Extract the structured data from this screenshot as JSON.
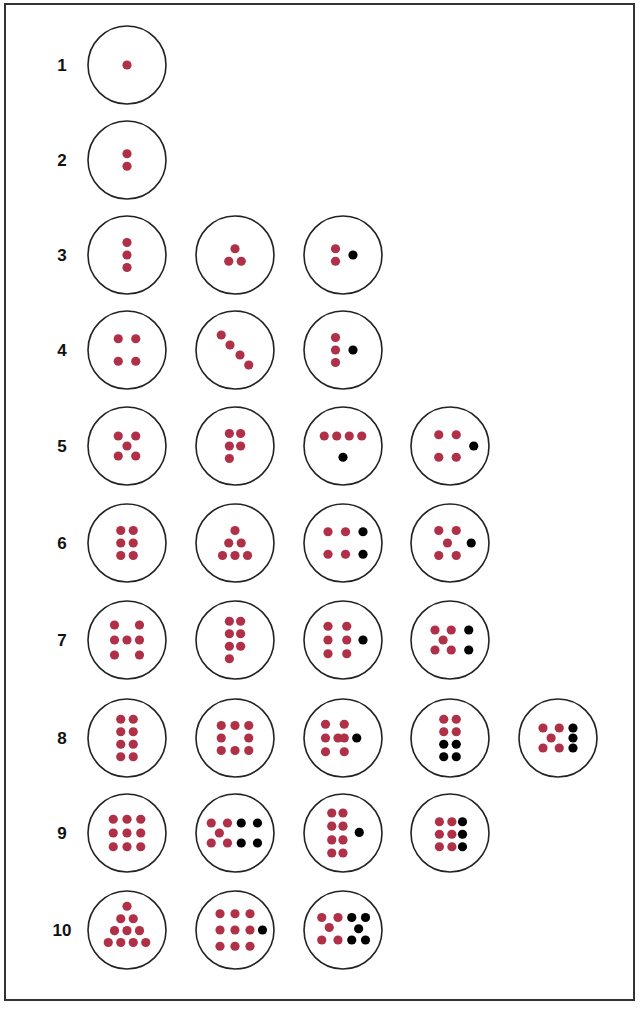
{
  "colors": {
    "counted_dot": "#b03048",
    "added_dot": "#000000",
    "circle_stroke": "#222222",
    "label": "#111111"
  },
  "rows": [
    {
      "label": "1",
      "patterns": [
        {
          "red": [
            [
              0,
              0
            ]
          ],
          "black": []
        }
      ]
    },
    {
      "label": "2",
      "patterns": [
        {
          "red": [
            [
              0,
              -0.5
            ],
            [
              0,
              0.5
            ]
          ],
          "black": []
        }
      ]
    },
    {
      "label": "3",
      "patterns": [
        {
          "red": [
            [
              0,
              -1
            ],
            [
              0,
              0
            ],
            [
              0,
              1
            ]
          ],
          "black": []
        },
        {
          "red": [
            [
              0,
              -0.5
            ],
            [
              -0.5,
              0.5
            ],
            [
              0.5,
              0.5
            ]
          ],
          "black": []
        },
        {
          "red": [
            [
              -0.6,
              -0.5
            ],
            [
              -0.6,
              0.5
            ]
          ],
          "black": [
            [
              0.8,
              0
            ]
          ]
        }
      ]
    },
    {
      "label": "4",
      "patterns": [
        {
          "red": [
            [
              -0.7,
              -0.9
            ],
            [
              0.7,
              -0.9
            ],
            [
              -0.7,
              0.9
            ],
            [
              0.7,
              0.9
            ]
          ],
          "black": []
        },
        {
          "red": [
            [
              -1.1,
              -1.2
            ],
            [
              -0.4,
              -0.4
            ],
            [
              0.4,
              0.4
            ],
            [
              1.1,
              1.2
            ]
          ],
          "black": []
        },
        {
          "red": [
            [
              -0.6,
              -1
            ],
            [
              -0.6,
              0
            ],
            [
              -0.6,
              1
            ]
          ],
          "black": [
            [
              0.8,
              0
            ]
          ]
        }
      ]
    },
    {
      "label": "5",
      "patterns": [
        {
          "red": [
            [
              -0.7,
              -0.8
            ],
            [
              0.7,
              -0.8
            ],
            [
              0,
              0
            ],
            [
              -0.7,
              0.8
            ],
            [
              0.7,
              0.8
            ]
          ],
          "black": []
        },
        {
          "red": [
            [
              -0.45,
              -1
            ],
            [
              0.45,
              -1
            ],
            [
              -0.45,
              0
            ],
            [
              0.45,
              0
            ],
            [
              -0.45,
              1
            ]
          ],
          "black": []
        },
        {
          "red": [
            [
              -1.5,
              -0.8
            ],
            [
              -0.5,
              -0.8
            ],
            [
              0.5,
              -0.8
            ],
            [
              1.5,
              -0.8
            ]
          ],
          "black": [
            [
              0,
              0.9
            ]
          ]
        },
        {
          "red": [
            [
              -0.9,
              -0.9
            ],
            [
              0.5,
              -0.9
            ],
            [
              -0.9,
              0.9
            ],
            [
              0.5,
              0.9
            ]
          ],
          "black": [
            [
              1.9,
              0
            ]
          ]
        }
      ]
    },
    {
      "label": "6",
      "patterns": [
        {
          "red": [
            [
              -0.5,
              -1
            ],
            [
              0.5,
              -1
            ],
            [
              -0.5,
              0
            ],
            [
              0.5,
              0
            ],
            [
              -0.5,
              1
            ],
            [
              0.5,
              1
            ]
          ],
          "black": []
        },
        {
          "red": [
            [
              0,
              -1
            ],
            [
              -0.5,
              0
            ],
            [
              0.5,
              0
            ],
            [
              -1,
              1
            ],
            [
              0,
              1
            ],
            [
              1,
              1
            ]
          ],
          "black": []
        },
        {
          "red": [
            [
              -1.2,
              -0.9
            ],
            [
              0.2,
              -0.9
            ],
            [
              -1.2,
              0.9
            ],
            [
              0.2,
              0.9
            ]
          ],
          "black": [
            [
              1.6,
              -0.9
            ],
            [
              1.6,
              0.9
            ]
          ]
        },
        {
          "red": [
            [
              -0.9,
              -1
            ],
            [
              0.5,
              -1
            ],
            [
              -0.2,
              0
            ],
            [
              -0.9,
              1
            ],
            [
              0.5,
              1
            ]
          ],
          "black": [
            [
              1.7,
              0
            ]
          ]
        }
      ]
    },
    {
      "label": "7",
      "patterns": [
        {
          "red": [
            [
              -1,
              -1.2
            ],
            [
              1,
              -1.2
            ],
            [
              -1,
              0
            ],
            [
              0,
              0
            ],
            [
              1,
              0
            ],
            [
              -1,
              1.2
            ],
            [
              1,
              1.2
            ]
          ],
          "black": []
        },
        {
          "red": [
            [
              -0.45,
              -1.5
            ],
            [
              0.45,
              -1.5
            ],
            [
              -0.45,
              -0.5
            ],
            [
              0.45,
              -0.5
            ],
            [
              -0.45,
              0.5
            ],
            [
              0.45,
              0.5
            ],
            [
              -0.45,
              1.5
            ]
          ],
          "black": []
        },
        {
          "red": [
            [
              -1.2,
              -1.1
            ],
            [
              0.3,
              -1.1
            ],
            [
              -1.2,
              0
            ],
            [
              0.3,
              0
            ],
            [
              -1.2,
              1.1
            ],
            [
              0.3,
              1.1
            ]
          ],
          "black": [
            [
              1.6,
              0
            ]
          ]
        },
        {
          "red": [
            [
              -1.2,
              -0.8
            ],
            [
              0.1,
              -0.8
            ],
            [
              -0.55,
              0
            ],
            [
              -1.2,
              0.8
            ],
            [
              0.1,
              0.8
            ]
          ],
          "black": [
            [
              1.5,
              -0.8
            ],
            [
              1.5,
              0.8
            ]
          ]
        }
      ]
    },
    {
      "label": "8",
      "patterns": [
        {
          "red": [
            [
              -0.5,
              -1.5
            ],
            [
              0.5,
              -1.5
            ],
            [
              -0.5,
              -0.5
            ],
            [
              0.5,
              -0.5
            ],
            [
              -0.5,
              0.5
            ],
            [
              0.5,
              0.5
            ],
            [
              -0.5,
              1.5
            ],
            [
              0.5,
              1.5
            ]
          ],
          "black": []
        },
        {
          "red": [
            [
              -1.1,
              -1
            ],
            [
              0,
              -1
            ],
            [
              1.1,
              -1
            ],
            [
              -1.1,
              0
            ],
            [
              1.1,
              0
            ],
            [
              -1.1,
              1
            ],
            [
              0,
              1
            ],
            [
              1.1,
              1
            ]
          ],
          "black": []
        },
        {
          "red": [
            [
              -1.4,
              -1.1
            ],
            [
              0.1,
              -1.1
            ],
            [
              -1.4,
              0
            ],
            [
              -0.4,
              0
            ],
            [
              0.1,
              0
            ],
            [
              -1.4,
              1.1
            ],
            [
              0.1,
              1.1
            ]
          ],
          "black": [
            [
              1.1,
              0
            ]
          ]
        },
        {
          "red": [
            [
              -0.5,
              -1.5
            ],
            [
              0.5,
              -1.5
            ],
            [
              -0.5,
              -0.5
            ],
            [
              0.5,
              -0.5
            ]
          ],
          "black": [
            [
              -0.5,
              0.5
            ],
            [
              0.5,
              0.5
            ],
            [
              -0.5,
              1.5
            ],
            [
              0.5,
              1.5
            ]
          ]
        },
        {
          "red": [
            [
              -1.2,
              -0.8
            ],
            [
              0.1,
              -0.8
            ],
            [
              -0.55,
              0
            ],
            [
              -1.2,
              0.8
            ],
            [
              0.1,
              0.8
            ]
          ],
          "black": [
            [
              1.2,
              -0.8
            ],
            [
              1.2,
              0
            ],
            [
              1.2,
              0.8
            ]
          ]
        }
      ]
    },
    {
      "label": "9",
      "patterns": [
        {
          "red": [
            [
              -1.1,
              -1.1
            ],
            [
              0,
              -1.1
            ],
            [
              1.1,
              -1.1
            ],
            [
              -1.1,
              0
            ],
            [
              0,
              0
            ],
            [
              1.1,
              0
            ],
            [
              -1.1,
              1.1
            ],
            [
              0,
              1.1
            ],
            [
              1.1,
              1.1
            ]
          ],
          "black": []
        },
        {
          "red": [
            [
              -1.9,
              -0.8
            ],
            [
              -0.6,
              -0.8
            ],
            [
              -1.25,
              0
            ],
            [
              -1.9,
              0.8
            ],
            [
              -0.6,
              0.8
            ]
          ],
          "black": [
            [
              0.5,
              -0.8
            ],
            [
              1.8,
              -0.8
            ],
            [
              0.5,
              0.8
            ],
            [
              1.8,
              0.8
            ]
          ]
        },
        {
          "red": [
            [
              -0.9,
              -1.6
            ],
            [
              0,
              -1.6
            ],
            [
              -0.9,
              -0.55
            ],
            [
              0,
              -0.55
            ],
            [
              -0.9,
              0.55
            ],
            [
              0,
              0.55
            ],
            [
              -0.9,
              1.6
            ],
            [
              0,
              1.6
            ]
          ],
          "black": [
            [
              1.3,
              -0.05
            ]
          ]
        },
        {
          "red": [
            [
              -0.85,
              -0.9
            ],
            [
              0.15,
              -0.9
            ],
            [
              -0.85,
              0.1
            ],
            [
              0.15,
              0.1
            ],
            [
              -0.85,
              1.1
            ],
            [
              0.15,
              1.1
            ]
          ],
          "black": [
            [
              1.0,
              -0.9
            ],
            [
              1.0,
              0.1
            ],
            [
              1.0,
              1.1
            ]
          ]
        }
      ]
    },
    {
      "label": "10",
      "patterns": [
        {
          "red": [
            [
              0,
              -1.9
            ],
            [
              -0.5,
              -0.9
            ],
            [
              0.5,
              -0.9
            ],
            [
              -1,
              0.05
            ],
            [
              0,
              0.05
            ],
            [
              1,
              0.05
            ],
            [
              -1.5,
              1
            ],
            [
              -0.5,
              1
            ],
            [
              0.5,
              1
            ],
            [
              1.5,
              1
            ]
          ],
          "black": []
        },
        {
          "red": [
            [
              -1.2,
              -1.3
            ],
            [
              0,
              -1.3
            ],
            [
              1.2,
              -1.3
            ],
            [
              -1.2,
              0
            ],
            [
              0,
              0
            ],
            [
              1.2,
              0
            ],
            [
              -1.2,
              1.3
            ],
            [
              0,
              1.3
            ],
            [
              1.2,
              1.3
            ]
          ],
          "black": [
            [
              2.2,
              0
            ]
          ]
        },
        {
          "red": [
            [
              -1.7,
              -1
            ],
            [
              -0.4,
              -1
            ],
            [
              -1.1,
              -0.2
            ],
            [
              -1.7,
              0.8
            ],
            [
              -0.4,
              0.8
            ]
          ],
          "black": [
            [
              0.7,
              -1
            ],
            [
              1.8,
              -1
            ],
            [
              1.25,
              -0.1
            ],
            [
              0.7,
              0.8
            ],
            [
              1.8,
              0.8
            ]
          ]
        }
      ]
    }
  ]
}
